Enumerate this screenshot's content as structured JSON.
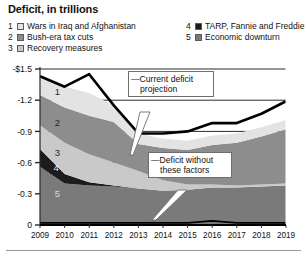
{
  "title": "Deficit, in trillions",
  "legend": {
    "left_items": [
      {
        "num": "1",
        "label": "Wars in Iraq and Afghanistan",
        "color": "#e3e3e3"
      },
      {
        "num": "2",
        "label": "Bush-era tax cuts",
        "color": "#8d8d8d"
      },
      {
        "num": "3",
        "label": "Recovery measures",
        "color": "#c9c9c9"
      }
    ],
    "right_items": [
      {
        "num": "4",
        "label": "TARP, Fannie and Freddie",
        "color": "#1c1c1c"
      },
      {
        "num": "5",
        "label": "Economic downturn",
        "color": "#7a7a7a"
      }
    ]
  },
  "callouts": {
    "projection": {
      "line1": "—Current deficit",
      "line2": "projection"
    },
    "without": {
      "line1": "—Deficit without",
      "line2": "these factors"
    }
  },
  "chart_data": {
    "type": "area",
    "title": "Deficit, in trillions",
    "xlabel": "",
    "ylabel": "",
    "grid": true,
    "legend_position": "top",
    "ylim": [
      0,
      -1.5
    ],
    "ytick_labels": [
      "-$1.5",
      "-1.2",
      "-0.9",
      "-0.6",
      "-0.3",
      "0"
    ],
    "ytick_values": [
      -1.5,
      -1.2,
      -0.9,
      -0.6,
      -0.3,
      0
    ],
    "categories": [
      "2009",
      "2010",
      "2011",
      "2012",
      "2013",
      "2014",
      "2015",
      "2016",
      "2017",
      "2018",
      "2019"
    ],
    "x": [
      2009,
      2010,
      2011,
      2012,
      2013,
      2014,
      2015,
      2016,
      2017,
      2018,
      2019
    ],
    "stack_order_bottom_to_top": [
      "Economic downturn",
      "TARP, Fannie and Freddie",
      "Recovery measures",
      "Bush-era tax cuts",
      "Wars in Iraq and Afghanistan"
    ],
    "series": [
      {
        "name": "Economic downturn",
        "id": "5",
        "color": "#7a7a7a",
        "values": [
          -0.56,
          -0.4,
          -0.38,
          -0.37,
          -0.35,
          -0.33,
          -0.34,
          -0.36,
          -0.36,
          -0.37,
          -0.38
        ]
      },
      {
        "name": "TARP, Fannie and Freddie",
        "id": "4",
        "color": "#1c1c1c",
        "values": [
          -0.17,
          -0.09,
          -0.03,
          -0.01,
          0.0,
          0.0,
          0.0,
          0.0,
          0.0,
          0.0,
          0.0
        ]
      },
      {
        "name": "Recovery measures",
        "id": "3",
        "color": "#c9c9c9",
        "values": [
          -0.23,
          -0.3,
          -0.27,
          -0.22,
          -0.17,
          -0.1,
          -0.05,
          -0.03,
          -0.02,
          -0.02,
          -0.02
        ]
      },
      {
        "name": "Bush-era tax cuts",
        "id": "2",
        "color": "#8d8d8d",
        "values": [
          -0.29,
          -0.34,
          -0.37,
          -0.39,
          -0.26,
          -0.31,
          -0.33,
          -0.38,
          -0.41,
          -0.46,
          -0.52
        ]
      },
      {
        "name": "Wars in Iraq and Afghanistan",
        "id": "1",
        "color": "#e3e3e3",
        "values": [
          -0.18,
          -0.2,
          -0.22,
          -0.16,
          -0.1,
          -0.09,
          -0.09,
          -0.09,
          -0.09,
          -0.09,
          -0.09
        ]
      }
    ],
    "lines": [
      {
        "name": "Current deficit projection",
        "style": "thick-black",
        "values": [
          -1.43,
          -1.33,
          -1.45,
          -1.15,
          -0.88,
          -0.88,
          -0.9,
          -0.98,
          -0.98,
          -1.07,
          -1.19
        ]
      },
      {
        "name": "Deficit without these factors",
        "style": "thin-black",
        "values": [
          -0.02,
          -0.02,
          -0.02,
          -0.02,
          -0.02,
          -0.02,
          -0.02,
          -0.04,
          -0.02,
          -0.02,
          -0.02
        ]
      }
    ],
    "band_labels": [
      {
        "text": "1",
        "x": 2009.6,
        "y": -1.28,
        "color": "#2a2a2a"
      },
      {
        "text": "2",
        "x": 2009.6,
        "y": -0.99,
        "color": "#2a2a2a"
      },
      {
        "text": "3",
        "x": 2009.6,
        "y": -0.7,
        "color": "#2a2a2a"
      },
      {
        "text": "4",
        "x": 2009.55,
        "y": -0.55,
        "color": "#e8e8e8"
      },
      {
        "text": "5",
        "x": 2009.6,
        "y": -0.3,
        "color": "#d8d8d8"
      }
    ]
  }
}
